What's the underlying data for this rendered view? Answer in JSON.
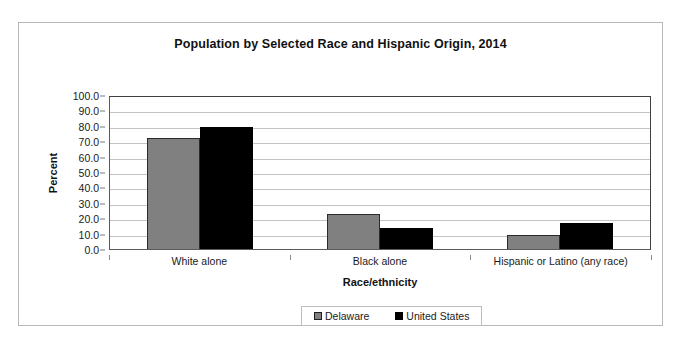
{
  "chart_data": {
    "type": "bar",
    "title": "Population by Selected Race and Hispanic Origin, 2014",
    "xlabel": "Race/ethnicity",
    "ylabel": "Percent",
    "ylim": [
      0,
      100
    ],
    "ytick_step": 10,
    "ytick_labels": [
      "100.0",
      "90.0",
      "80.0",
      "70.0",
      "60.0",
      "50.0",
      "40.0",
      "30.0",
      "20.0",
      "10.0",
      "0.0"
    ],
    "grid": true,
    "legend_position": "bottom-center",
    "categories": [
      "White alone",
      "Black alone",
      "Hispanic or Latino (any race)"
    ],
    "series": [
      {
        "name": "Delaware",
        "color": "#808080",
        "values": [
          72.0,
          22.5,
          9.0
        ]
      },
      {
        "name": "United States",
        "color": "#000000",
        "values": [
          79.0,
          13.5,
          17.0
        ]
      }
    ]
  }
}
